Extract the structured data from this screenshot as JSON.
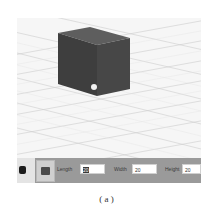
{
  "viewport": {
    "object": "cube",
    "colors": {
      "top": "#5c5c5c",
      "front": "#3f3f3f",
      "side": "#4a4a4a",
      "grid": "#c8c8c8",
      "background": "#f6f6f6"
    },
    "handle": "white-dot"
  },
  "toolbar": {
    "tool_icon": "cube-icon",
    "fields": [
      {
        "label": "Length",
        "value": "20",
        "selected": true
      },
      {
        "label": "Width",
        "value": "20",
        "selected": false
      },
      {
        "label": "Height",
        "value": "20",
        "selected": false
      }
    ]
  },
  "caption": "( a )"
}
